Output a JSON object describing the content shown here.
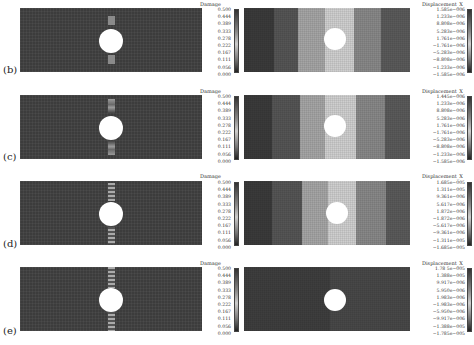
{
  "figure": {
    "rows": [
      {
        "label": "(b)",
        "damage": {
          "title": "Damage",
          "ticks": [
            "0.500",
            "0.444",
            "0.389",
            "0.333",
            "0.278",
            "0.222",
            "0.167",
            "0.111",
            "0.056",
            "0.000"
          ]
        },
        "displacement": {
          "title": "Displacement_X",
          "ticks": [
            "1.585e−006",
            "1.233e−006",
            "8.808e−006",
            "5.283e−006",
            "1.761e−006",
            "−1.761e−006",
            "−5.283e−006",
            "−8.808e−006",
            "−1.233e−006",
            "−1.585e−006"
          ]
        }
      },
      {
        "label": "(c)",
        "damage": {
          "title": "Damage",
          "ticks": [
            "0.500",
            "0.444",
            "0.389",
            "0.333",
            "0.278",
            "0.222",
            "0.167",
            "0.111",
            "0.056",
            "0.000"
          ]
        },
        "displacement": {
          "title": "Displacement_X",
          "ticks": [
            "1.445e−006",
            "1.233e−006",
            "8.808e−006",
            "5.283e−006",
            "1.761e−006",
            "−1.761e−006",
            "−5.283e−006",
            "−8.808e−006",
            "−1.233e−006",
            "−1.585e−006"
          ]
        }
      },
      {
        "label": "(d)",
        "damage": {
          "title": "Damage",
          "ticks": [
            "0.500",
            "0.444",
            "0.389",
            "0.333",
            "0.278",
            "0.222",
            "0.167",
            "0.111",
            "0.056",
            "0.000"
          ]
        },
        "displacement": {
          "title": "Displacement_X",
          "ticks": [
            "1.685e−005",
            "1.311e−005",
            "9.361e−006",
            "5.617e−006",
            "1.872e−006",
            "−1.872e−006",
            "−5.617e−006",
            "−9.361e−006",
            "−1.311e−005",
            "−1.685e−005"
          ]
        }
      },
      {
        "label": "(e)",
        "damage": {
          "title": "Damage",
          "ticks": [
            "0.500",
            "0.444",
            "0.389",
            "0.333",
            "0.278",
            "0.222",
            "0.167",
            "0.111",
            "0.056",
            "0.000"
          ]
        },
        "displacement": {
          "title": "Displacement_X",
          "ticks": [
            "1.78 5e−005",
            "1.388e−005",
            "9.917e−006",
            "5.950e−006",
            "1.983e−006",
            "−1.983e−006",
            "−5.950e−006",
            "−9.917e−006",
            "−1.388e−005",
            "−1.785e−005"
          ]
        }
      }
    ],
    "colors": {
      "damage_bg": "#3c3c3c",
      "damage_band": "#9a9a9a",
      "hole": "#ffffff"
    }
  }
}
